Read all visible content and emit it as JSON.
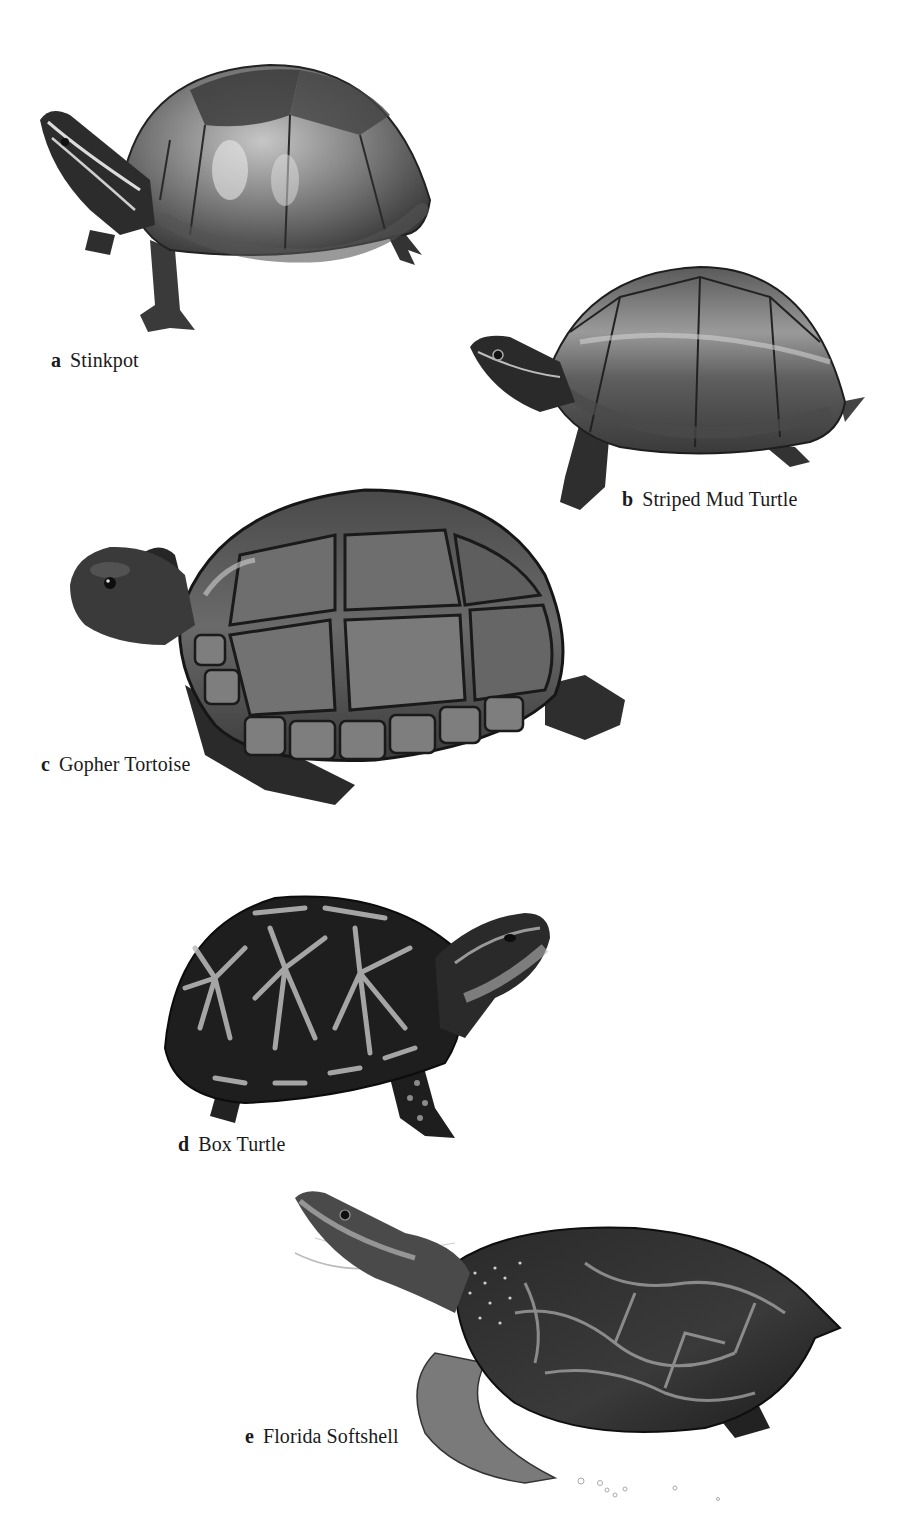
{
  "plate": {
    "figures": [
      {
        "id": "a",
        "letter": "a",
        "name": "Stinkpot"
      },
      {
        "id": "b",
        "letter": "b",
        "name": "Striped Mud Turtle"
      },
      {
        "id": "c",
        "letter": "c",
        "name": "Gopher Tortoise"
      },
      {
        "id": "d",
        "letter": "d",
        "name": "Box Turtle"
      },
      {
        "id": "e",
        "letter": "e",
        "name": "Florida Softshell"
      }
    ]
  },
  "colors": {
    "background": "#ffffff",
    "ink": "#1a1a1a",
    "shell_dark": "#2a2a2a",
    "shell_mid": "#6e6e6e",
    "shell_light": "#a8a8a8",
    "pattern_light": "#c8c8c8"
  }
}
